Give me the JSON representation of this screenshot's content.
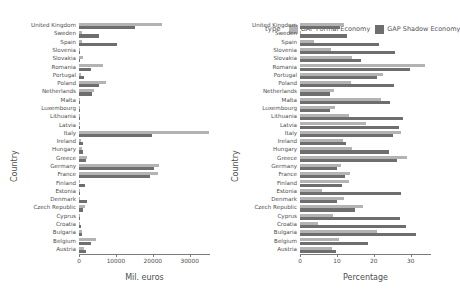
{
  "chart_data": {
    "type": "bar",
    "orientation": "horizontal",
    "title": "",
    "legend_title": "type",
    "legend_position": "top-right",
    "grid": false,
    "series_names": [
      "GAP Formal Economy",
      "GAP Shadow Economy"
    ],
    "colors": {
      "formal": "#b3b3b3",
      "shadow": "#6e6e6e",
      "axis": "#7a7a7a",
      "text": "#4d4d4d",
      "background": "#ffffff"
    },
    "categories": [
      "United Kingdom",
      "Sweden",
      "Spain",
      "Slovenia",
      "Slovakia",
      "Romania",
      "Portugal",
      "Poland",
      "Netherlands",
      "Malta",
      "Luxembourg",
      "Lithuania",
      "Latvia",
      "Italy",
      "Ireland",
      "Hungary",
      "Greece",
      "Germany",
      "France",
      "Finland",
      "Estonia",
      "Denmark",
      "Czech Republic",
      "Cyprus",
      "Croatia",
      "Bulgaria",
      "Belgium",
      "Austria"
    ],
    "panels": [
      {
        "id": "absolute",
        "xlabel": "Mil. euros",
        "ylabel": "Country",
        "xlim": [
          0,
          35500
        ],
        "xticks": [
          0,
          10000,
          20000,
          30000
        ],
        "xtick_labels": [
          "0",
          "10000",
          "20000",
          "30000"
        ],
        "series": [
          {
            "name": "GAP Formal Economy",
            "key": "formal",
            "values": [
              22600,
              700,
              900,
              250,
              1150,
              6400,
              600,
              7300,
              4200,
              120,
              120,
              400,
              230,
              35200,
              520,
              900,
              2100,
              21800,
              21500,
              350,
              160,
              400,
              1600,
              130,
              350,
              900,
              4600,
              1300
            ]
          },
          {
            "name": "GAP Shadow Economy",
            "key": "shadow",
            "values": [
              15200,
              5500,
              10400,
              350,
              400,
              3200,
              1400,
              5400,
              3500,
              60,
              70,
              400,
              200,
              19800,
              1100,
              1200,
              1900,
              20400,
              19300,
              1500,
              130,
              2100,
              1200,
              70,
              600,
              700,
              3300,
              1900
            ]
          }
        ]
      },
      {
        "id": "percentage",
        "xlabel": "Percentage",
        "ylabel": "Country",
        "xlim": [
          0,
          35.5
        ],
        "xticks": [
          0,
          10,
          20,
          30
        ],
        "xtick_labels": [
          "0",
          "10",
          "20",
          "30"
        ],
        "series": [
          {
            "name": "GAP Formal Economy",
            "key": "formal",
            "values": [
              11.8,
              0.4,
              3.8,
              8.5,
              14.0,
              34.0,
              22.5,
              13.7,
              9.1,
              22.0,
              9.5,
              13.2,
              17.8,
              27.5,
              11.6,
              14.2,
              29.0,
              11.2,
              13.5,
              13.2,
              6.0,
              12.0,
              17.2,
              9.0,
              4.8,
              21.0,
              10.5,
              8.8
            ]
          },
          {
            "name": "GAP Shadow Economy",
            "key": "shadow",
            "values": [
              10.8,
              12.8,
              21.5,
              25.8,
              16.5,
              29.8,
              21.0,
              25.5,
              8.2,
              24.5,
              8.2,
              27.8,
              26.8,
              25.2,
              12.4,
              24.0,
              26.2,
              10.0,
              12.2,
              11.5,
              27.5,
              10.0,
              14.8,
              27.0,
              28.8,
              31.5,
              18.5,
              9.8
            ]
          }
        ]
      }
    ]
  }
}
